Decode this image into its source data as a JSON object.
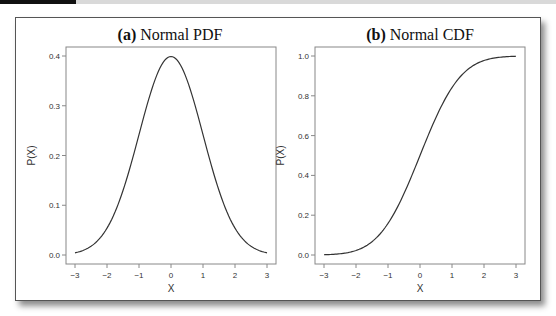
{
  "chart_data": [
    {
      "type": "line",
      "title_prefix": "(a)",
      "title_text": "Normal PDF",
      "title": "(a) Normal PDF",
      "xlabel": "X",
      "ylabel": "P(X)",
      "xlim": [
        -3,
        3
      ],
      "ylim": [
        0,
        0.4
      ],
      "xticks": [
        -3,
        -2,
        -1,
        0,
        1,
        2,
        3
      ],
      "xtick_labels": [
        "−3",
        "−2",
        "−1",
        "0",
        "1",
        "2",
        "3"
      ],
      "yticks": [
        0.0,
        0.1,
        0.2,
        0.3,
        0.4
      ],
      "ytick_labels": [
        "0.0",
        "0.1",
        "0.2",
        "0.3",
        "0.4"
      ],
      "grid": false,
      "function": "normal_pdf",
      "x": [
        -3,
        -2.5,
        -2,
        -1.5,
        -1,
        -0.5,
        0,
        0.5,
        1,
        1.5,
        2,
        2.5,
        3
      ],
      "y": [
        0.0044,
        0.0175,
        0.054,
        0.1295,
        0.242,
        0.3521,
        0.3989,
        0.3521,
        0.242,
        0.1295,
        0.054,
        0.0175,
        0.0044
      ]
    },
    {
      "type": "line",
      "title_prefix": "(b)",
      "title_text": "Normal CDF",
      "title": "(b) Normal CDF",
      "xlabel": "X",
      "ylabel": "P(X)",
      "xlim": [
        -3,
        3
      ],
      "ylim": [
        0,
        1.0
      ],
      "xticks": [
        -3,
        -2,
        -1,
        0,
        1,
        2,
        3
      ],
      "xtick_labels": [
        "−3",
        "−2",
        "−1",
        "0",
        "1",
        "2",
        "3"
      ],
      "yticks": [
        0.0,
        0.2,
        0.4,
        0.6,
        0.8,
        1.0
      ],
      "ytick_labels": [
        "0.0",
        "0.2",
        "0.4",
        "0.6",
        "0.8",
        "1.0"
      ],
      "grid": false,
      "function": "normal_cdf",
      "x": [
        -3,
        -2.5,
        -2,
        -1.5,
        -1,
        -0.5,
        0,
        0.5,
        1,
        1.5,
        2,
        2.5,
        3
      ],
      "y": [
        0.0013,
        0.0062,
        0.0228,
        0.0668,
        0.1587,
        0.3085,
        0.5,
        0.6915,
        0.8413,
        0.9332,
        0.9772,
        0.9938,
        0.9987
      ]
    }
  ],
  "colors": {
    "line": "#333333",
    "axis": "#888888",
    "frame": "#555555"
  }
}
